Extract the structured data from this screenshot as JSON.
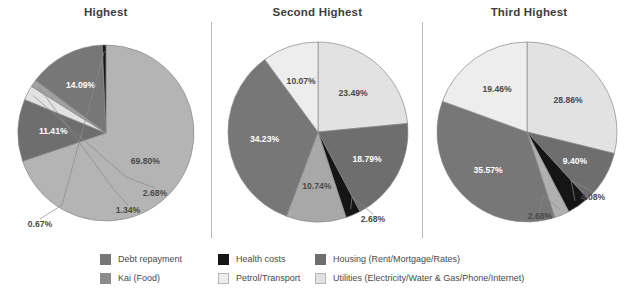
{
  "chart_data": [
    {
      "type": "pie",
      "title": "Highest",
      "categories": [
        "Utilities (Electricity/Water & Gas/Phone/Internet)",
        "Housing (Rent/Mortgage/Rates)",
        "Petrol/Transport",
        "Debt repayment",
        "Kai (Food)",
        "Health costs"
      ],
      "values": [
        69.8,
        11.41,
        2.68,
        1.34,
        14.09,
        0.67
      ],
      "labels": [
        "69.80%",
        "11.41%",
        "2.68%",
        "1.34%",
        "14.09%",
        "0.67%"
      ],
      "colors": [
        "#b4b4b4",
        "#6e6e6e",
        "#e2e2e2",
        "#a0a0a0",
        "#777777",
        "#151515"
      ],
      "label_colors": [
        "#4a4a4a",
        "#ffffff",
        "#4a4a4a",
        "#4a4a4a",
        "#ffffff",
        "#4a4a4a"
      ],
      "legend_position": "bottom"
    },
    {
      "type": "pie",
      "title": "Second Highest",
      "categories": [
        "Utilities (Electricity/Water & Gas/Phone/Internet)",
        "Housing (Rent/Mortgage/Rates)",
        "Health costs",
        "Petrol/Transport",
        "Kai (Food)",
        "Debt repayment"
      ],
      "values": [
        23.49,
        18.79,
        2.68,
        10.74,
        34.23,
        10.07
      ],
      "labels": [
        "23.49%",
        "18.79%",
        "2.68%",
        "10.74%",
        "34.23%",
        "10.07%"
      ],
      "colors": [
        "#e2e2e2",
        "#6e6e6e",
        "#151515",
        "#a8a8a8",
        "#777777",
        "#ededed"
      ],
      "label_colors": [
        "#4a4a4a",
        "#ffffff",
        "#4a4a4a",
        "#4a4a4a",
        "#ffffff",
        "#4a4a4a"
      ],
      "legend_position": "bottom"
    },
    {
      "type": "pie",
      "title": "Third Highest",
      "categories": [
        "Utilities (Electricity/Water & Gas/Phone/Internet)",
        "Housing (Rent/Mortgage/Rates)",
        "Health costs",
        "Petrol/Transport",
        "Kai (Food)",
        "Debt repayment"
      ],
      "values": [
        28.86,
        9.4,
        4.08,
        2.68,
        35.57,
        19.46
      ],
      "labels": [
        "28.86%",
        "9.40%",
        "4.08%",
        "2.68%",
        "35.57%",
        "19.46%"
      ],
      "colors": [
        "#e2e2e2",
        "#6e6e6e",
        "#151515",
        "#b0b0b0",
        "#777777",
        "#ededed"
      ],
      "label_colors": [
        "#4a4a4a",
        "#ffffff",
        "#4a4a4a",
        "#4a4a4a",
        "#ffffff",
        "#4a4a4a"
      ],
      "legend_position": "bottom"
    }
  ],
  "panels": [
    {
      "title": "Highest"
    },
    {
      "title": "Second Highest"
    },
    {
      "title": "Third Highest"
    }
  ],
  "legend": {
    "columns": [
      {
        "items": [
          {
            "label": "Debt repayment",
            "color": "#777777"
          },
          {
            "label": "Kai (Food)",
            "color": "#8c8c8c"
          }
        ]
      },
      {
        "items": [
          {
            "label": "Health costs",
            "color": "#151515"
          },
          {
            "label": "Petrol/Transport",
            "color": "#ededed"
          }
        ]
      },
      {
        "items": [
          {
            "label": "Housing (Rent/Mortgage/Rates)",
            "color": "#6e6e6e"
          },
          {
            "label": "Utilities (Electricity/Water & Gas/Phone/Internet)",
            "color": "#e2e2e2"
          }
        ]
      }
    ]
  },
  "style": {
    "background": "#ffffff",
    "divider_color": "#b9b9b9",
    "title_color": "#3d3d3d",
    "text_color": "#4a4a4a"
  }
}
